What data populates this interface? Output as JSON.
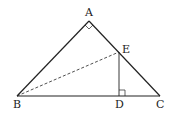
{
  "diagram": {
    "type": "geometry",
    "points": {
      "A": {
        "label": "A",
        "x": 89,
        "y": 21
      },
      "B": {
        "label": "B",
        "x": 17,
        "y": 96
      },
      "C": {
        "label": "C",
        "x": 160,
        "y": 96
      },
      "D": {
        "label": "D",
        "x": 119,
        "y": 96
      },
      "E": {
        "label": "E",
        "x": 119,
        "y": 52
      }
    },
    "segments": [
      {
        "from": "A",
        "to": "B",
        "style": "solid"
      },
      {
        "from": "A",
        "to": "C",
        "style": "solid"
      },
      {
        "from": "B",
        "to": "C",
        "style": "solid"
      },
      {
        "from": "E",
        "to": "D",
        "style": "solid"
      },
      {
        "from": "B",
        "to": "E",
        "style": "dashed"
      }
    ],
    "right_angles": [
      "A",
      "D"
    ],
    "line_color": "#222222"
  }
}
